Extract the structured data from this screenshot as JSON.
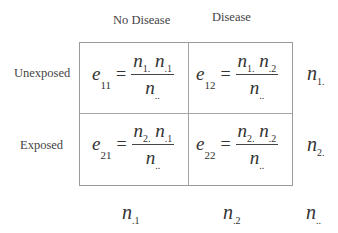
{
  "column_headers": [
    "No Disease",
    "Disease"
  ],
  "row_headers": [
    "Unexposed",
    "Exposed"
  ],
  "cells": [
    {
      "lhs": "e",
      "lhs_sub": "11",
      "num": [
        {
          "v": "n",
          "s": "1."
        },
        {
          "v": "n",
          "s": ".1"
        }
      ],
      "den": {
        "v": "n",
        "s": ".."
      }
    },
    {
      "lhs": "e",
      "lhs_sub": "12",
      "num": [
        {
          "v": "n",
          "s": "1."
        },
        {
          "v": "n",
          "s": ".2"
        }
      ],
      "den": {
        "v": "n",
        "s": ".."
      }
    },
    {
      "lhs": "e",
      "lhs_sub": "21",
      "num": [
        {
          "v": "n",
          "s": "2."
        },
        {
          "v": "n",
          "s": ".1"
        }
      ],
      "den": {
        "v": "n",
        "s": ".."
      }
    },
    {
      "lhs": "e",
      "lhs_sub": "22",
      "num": [
        {
          "v": "n",
          "s": "2."
        },
        {
          "v": "n",
          "s": ".2"
        }
      ],
      "den": {
        "v": "n",
        "s": ".."
      }
    }
  ],
  "row_totals": [
    {
      "v": "n",
      "s": "1."
    },
    {
      "v": "n",
      "s": "2."
    }
  ],
  "column_totals": [
    {
      "v": "n",
      "s": ".1"
    },
    {
      "v": "n",
      "s": ".2"
    }
  ],
  "grand_total": {
    "v": "n",
    "s": ".."
  },
  "eq_sign": "="
}
